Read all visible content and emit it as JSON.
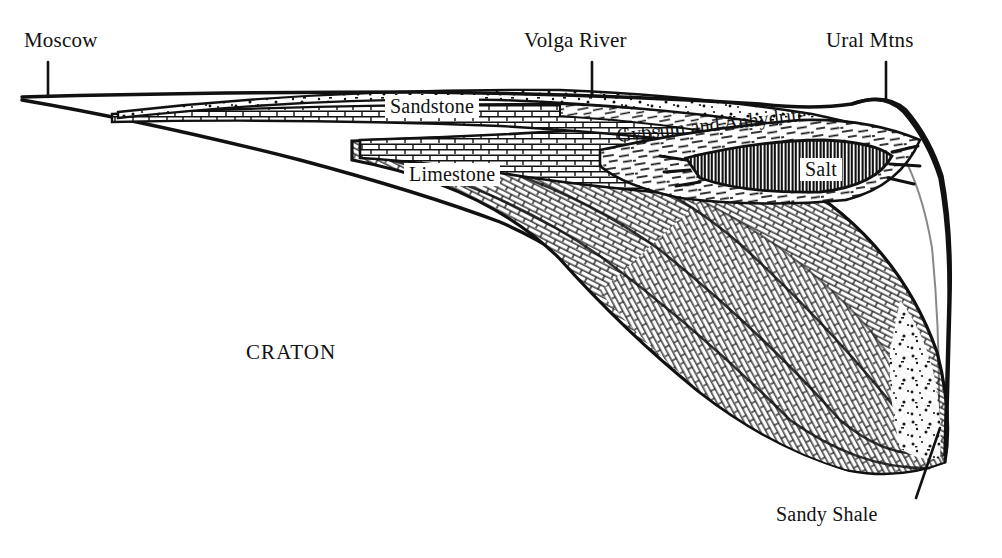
{
  "figure": {
    "kind": "geologic-cross-section",
    "orientation": "west-to-east",
    "background_color": "#ffffff",
    "ink_color": "#111111"
  },
  "locality_labels": [
    {
      "id": "moscow",
      "text": "Moscow",
      "leader": "vertical-tick-down"
    },
    {
      "id": "volga",
      "text": "Volga River",
      "leader": "vertical-tick-down"
    },
    {
      "id": "ural",
      "text": "Ural Mtns",
      "leader": "vertical-tick-down"
    }
  ],
  "unit_labels": [
    {
      "id": "sandstone",
      "text": "Sandstone",
      "pattern": "stipple",
      "boxed": false
    },
    {
      "id": "limestone",
      "text": "Limestone",
      "pattern": "brick",
      "boxed": true
    },
    {
      "id": "gypsum",
      "text": "Gypsum and Anhydrite",
      "pattern": "fine-dash",
      "boxed": false
    },
    {
      "id": "salt",
      "text": "Salt",
      "pattern": "vertical-hatch",
      "boxed": true
    },
    {
      "id": "shale",
      "text": "Sandy Shale",
      "pattern": "brick",
      "boxed": false
    }
  ],
  "region_labels": [
    {
      "id": "craton",
      "text": "CRATON"
    }
  ],
  "leaders": {
    "sandy_shale": "diagonal-up-right"
  }
}
